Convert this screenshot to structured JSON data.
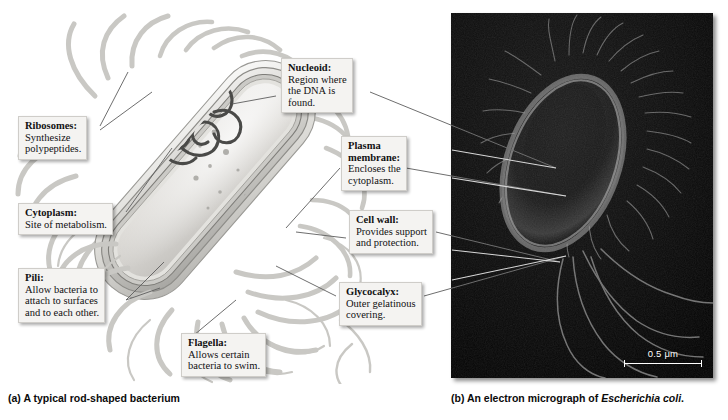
{
  "figure": {
    "panel_a": {
      "caption_prefix": "(a)",
      "caption_text": "A typical rod-shaped bacterium",
      "subject": "rod-shaped-bacterium-illustration"
    },
    "panel_b": {
      "caption_prefix": "(b)",
      "caption_text": "An electron micrograph of",
      "caption_species": "Escherichia coli",
      "caption_end": ".",
      "scale_bar": {
        "value": "0.5",
        "unit": "μm",
        "label": "0.5 μm"
      }
    }
  },
  "labels": [
    {
      "id": "ribosomes",
      "headword": "Ribosomes:",
      "body": [
        "Synthesize",
        "polypeptides."
      ]
    },
    {
      "id": "cytoplasm",
      "headword": "Cytoplasm:",
      "body": [
        "Site of metabolism."
      ]
    },
    {
      "id": "pili",
      "headword": "Pili:",
      "body": [
        "Allow bacteria to",
        "attach to surfaces",
        "and to each other."
      ]
    },
    {
      "id": "nucleoid",
      "headword": "Nucleoid:",
      "body": [
        "Region where",
        "the DNA is",
        "found."
      ]
    },
    {
      "id": "plasma-membrane",
      "headword": "Plasma",
      "headword2": "membrane:",
      "body": [
        "Encloses the",
        "cytoplasm."
      ]
    },
    {
      "id": "cell-wall",
      "headword": "Cell wall:",
      "body": [
        "Provides support",
        "and protection."
      ]
    },
    {
      "id": "glycocalyx",
      "headword": "Glycocalyx:",
      "body": [
        "Outer gelatinous",
        "covering."
      ]
    },
    {
      "id": "flagella",
      "headword": "Flagella:",
      "body": [
        "Allows certain",
        "bacteria to swim."
      ]
    }
  ],
  "colors": {
    "page_background": "#ffffff",
    "label_background": "#f4f3f1",
    "label_border": "#cfcdc9",
    "text": "#111111",
    "leader_line": "#6e6e6e",
    "micrograph_background": "#050505",
    "cell_envelope_light": "#e8e7e4",
    "cell_envelope_mid": "#b9b8b4",
    "cell_envelope_dark": "#8d8c88",
    "cytoplasm": "#dedcd8",
    "nucleoid": "#4a4a48",
    "appendage": "#c9c8c4",
    "scale_bar": "#ffffff"
  }
}
